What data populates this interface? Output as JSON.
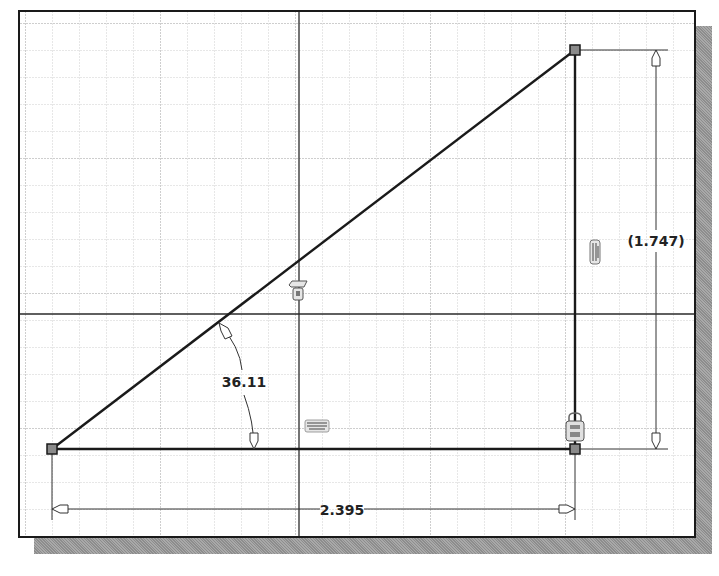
{
  "window": {
    "type": "cad-sketch-canvas"
  },
  "sketch": {
    "points": [
      {
        "name": "start-point",
        "x": 50,
        "y": 447
      },
      {
        "name": "corner-point",
        "x": 573,
        "y": 447
      },
      {
        "name": "top-point",
        "x": 573,
        "y": 48
      }
    ],
    "origin_axes": {
      "vertical_x": 297,
      "horizontal_y": 312
    }
  },
  "dimensions": {
    "angle": {
      "label": "36.11",
      "units": "degrees"
    },
    "horizontal": {
      "label": "2.395"
    },
    "vertical": {
      "label": "(1.747)",
      "reference": true
    }
  },
  "constraints": [
    {
      "type": "parallel",
      "icon": "parallel-constraint-icon"
    },
    {
      "type": "fix",
      "icon": "fix-constraint-icon"
    },
    {
      "type": "horizontal",
      "icon": "horizontal-constraint-icon"
    },
    {
      "type": "coincident-lock",
      "icon": "lock-constraint-icon"
    }
  ],
  "colors": {
    "geometry": "#1a1a1a",
    "grid_minor": "#c8c8c8",
    "grid_major": "#a8a8a8",
    "point_fill": "#8a8a8a",
    "shadow": "#9a9a9a"
  }
}
